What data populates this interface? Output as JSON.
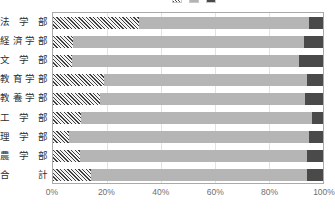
{
  "chart_data": {
    "type": "bar",
    "orientation": "horizontal",
    "stacked": true,
    "normalized_percent": true,
    "title": "",
    "xlabel": "",
    "ylabel": "",
    "xlim": [
      0,
      100
    ],
    "grid": true,
    "legend_position": "top-right",
    "legend_clipped": true,
    "categories": [
      "法 学 部",
      "経済学部",
      "文 学 部",
      "教育学部",
      "教養学部",
      "工 学 部",
      "理 学 部",
      "農 学 部",
      "合    計"
    ],
    "xticks": [
      "0%",
      "20%",
      "40%",
      "60%",
      "80%",
      "100%"
    ],
    "xtick_values": [
      0,
      20,
      40,
      60,
      80,
      100
    ],
    "series": [
      {
        "name": "series-1",
        "style": "hatched",
        "color": "#3f3f3f",
        "values": [
          32.0,
          7.5,
          7.0,
          19.0,
          17.5,
          10.5,
          6.0,
          10.0,
          14.0
        ]
      },
      {
        "name": "series-2",
        "style": "solid",
        "color": "#b5b5b5",
        "values": [
          63.0,
          85.5,
          84.0,
          75.0,
          76.0,
          85.5,
          89.0,
          84.0,
          80.0
        ]
      },
      {
        "name": "series-3",
        "style": "solid",
        "color": "#4a4a4a",
        "values": [
          5.0,
          7.0,
          9.0,
          6.0,
          6.5,
          4.0,
          5.0,
          6.0,
          6.0
        ]
      }
    ]
  },
  "colors": {
    "hatch": "#3f3f3f",
    "mid": "#b5b5b5",
    "dark": "#4a4a4a",
    "grid": "#e2e2e2",
    "frame": "#aaaaaa",
    "text": "#2e2e2e",
    "tick_text": "#6f6f6f"
  }
}
